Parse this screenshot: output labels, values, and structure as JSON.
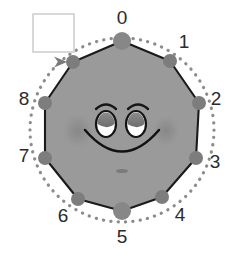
{
  "figure": {
    "title": "",
    "background_color": "#ffffff",
    "face_fill": "#9a9a9a",
    "face_stroke": "#1a1a1a",
    "vertex_color": "#7d7d7d",
    "vertex_color_major": "#878787",
    "dotted_circle_color": "#8c8c8c",
    "label_color": "#2b2b2b",
    "legend_box": {
      "name": "empty-legend-box",
      "fill": "#ffffff",
      "border": "#cfcfcf",
      "x": 33,
      "y": 14,
      "width": 41,
      "height": 38,
      "text": ""
    },
    "arrow": {
      "name": "direction-arrow",
      "color": "#7a7a7a",
      "points_to_vertex": 9,
      "direction": "clockwise"
    },
    "polygon": {
      "sides": 10,
      "center_x": 122,
      "center_y": 130,
      "radius": 89
    },
    "vertices": [
      {
        "index": 0,
        "label": "0",
        "cx": 122,
        "cy": 41,
        "r": 9,
        "label_x": 122,
        "label_y": 19,
        "labeled": true
      },
      {
        "index": 1,
        "label": "1",
        "cx": 170,
        "cy": 61,
        "r": 7,
        "label_x": 184,
        "label_y": 43,
        "labeled": true
      },
      {
        "index": 2,
        "label": "2",
        "cx": 199,
        "cy": 103,
        "r": 7,
        "label_x": 216,
        "label_y": 100,
        "labeled": true
      },
      {
        "index": 3,
        "label": "3",
        "cx": 196,
        "cy": 158,
        "r": 7,
        "label_x": 215,
        "label_y": 163,
        "labeled": true
      },
      {
        "index": 4,
        "label": "4",
        "cx": 162,
        "cy": 197,
        "r": 7,
        "label_x": 180,
        "label_y": 216,
        "labeled": true
      },
      {
        "index": 5,
        "label": "5",
        "cx": 122,
        "cy": 211,
        "r": 9,
        "label_x": 122,
        "label_y": 238,
        "labeled": true
      },
      {
        "index": 6,
        "label": "6",
        "cx": 78,
        "cy": 199,
        "r": 7,
        "label_x": 63,
        "label_y": 217,
        "labeled": true
      },
      {
        "index": 7,
        "label": "7",
        "cx": 45,
        "cy": 158,
        "r": 7,
        "label_x": 24,
        "label_y": 157,
        "labeled": true
      },
      {
        "index": 8,
        "label": "8",
        "cx": 45,
        "cy": 103,
        "r": 7,
        "label_x": 24,
        "label_y": 100,
        "labeled": true
      },
      {
        "index": 9,
        "label": "",
        "cx": 73,
        "cy": 62,
        "r": 7,
        "label_x": 73,
        "label_y": 40,
        "labeled": false
      }
    ],
    "face": {
      "left_eye": {
        "cx": 106,
        "cy": 124,
        "rx": 10,
        "ry": 13
      },
      "right_eye": {
        "cx": 136,
        "cy": 124,
        "rx": 10,
        "ry": 13
      },
      "eye_iris_color": "#7e7e7e",
      "eye_white_color": "#ffffff",
      "eye_outline_color": "#141414",
      "left_brow": {
        "cx": 106,
        "cy": 106
      },
      "right_brow": {
        "cx": 138,
        "cy": 106
      },
      "smile": {
        "cx": 122,
        "cy": 130,
        "width": 74,
        "depth": 32
      },
      "chin_mark": {
        "cx": 122,
        "cy": 171,
        "rx": 6,
        "ry": 2
      },
      "left_blush": {
        "cx": 78,
        "cy": 131,
        "rx": 17,
        "ry": 19
      },
      "right_blush": {
        "cx": 166,
        "cy": 131,
        "rx": 15,
        "ry": 17
      }
    }
  }
}
